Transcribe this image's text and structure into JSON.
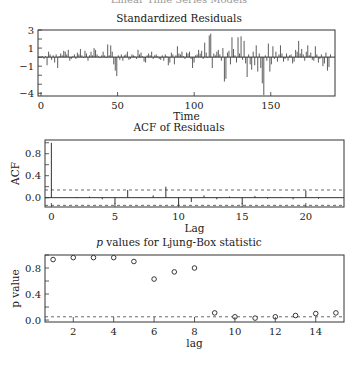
{
  "page": {
    "header": "Linear Time Series Models"
  },
  "chart_data": [
    {
      "type": "bar",
      "title": "Standardized Residuals",
      "xlabel": "Time",
      "ylabel": "",
      "xlim": [
        0,
        190
      ],
      "ylim": [
        -4.3,
        3
      ],
      "xticks": [
        0,
        50,
        100,
        150
      ],
      "yticks": [
        3,
        1,
        -1,
        -4
      ],
      "values": [
        0.0,
        0.1,
        -0.2,
        0.1,
        -0.9,
        0.6,
        0.3,
        -0.3,
        0.2,
        -0.6,
        0.3,
        -1.2,
        0.1,
        0.4,
        0.2,
        0.7,
        0.6,
        0.3,
        0.8,
        -0.4,
        -0.2,
        0.1,
        0.3,
        -0.2,
        0.5,
        0.3,
        0.9,
        0.2,
        -0.1,
        0.7,
        0.4,
        -0.4,
        0.2,
        0.6,
        0.2,
        1.0,
        0.8,
        0.3,
        0.1,
        -0.1,
        0.2,
        0.6,
        0.2,
        -0.1,
        1.4,
        0.2,
        1.3,
        0.6,
        -0.8,
        -1.5,
        -2.1,
        0.2,
        -0.3,
        0.3,
        -0.4,
        0.2,
        0.3,
        0.6,
        -0.3,
        -0.2,
        0.3,
        0.2,
        0.1,
        -0.2,
        0.8,
        0.3,
        0.5,
        0.1,
        -0.5,
        -0.6,
        0.2,
        0.4,
        0.2,
        0.6,
        -0.2,
        0.2,
        0.3,
        0.1,
        -0.2,
        -0.3,
        0.2,
        -0.4,
        0.3,
        0.1,
        -0.9,
        -0.6,
        0.5,
        0.3,
        -0.8,
        0.2,
        1.2,
        0.4,
        0.3,
        0.6,
        0.1,
        -0.2,
        0.5,
        0.4,
        0.6,
        -0.2,
        -1.2,
        -0.6,
        0.2,
        0.3,
        0.8,
        0.4,
        0.7,
        -0.2,
        1.6,
        0.5,
        -0.1,
        2.4,
        2.6,
        -1.2,
        0.4,
        0.2,
        0.6,
        0.8,
        0.3,
        -0.4,
        1.0,
        -2.7,
        -2.4,
        0.5,
        0.7,
        -0.8,
        2.2,
        0.9,
        0.2,
        -0.6,
        2.2,
        0.4,
        2.3,
        -0.3,
        1.8,
        -0.7,
        -2.2,
        0.3,
        -0.8,
        -1.4,
        0.6,
        -0.9,
        1.3,
        -1.6,
        0.4,
        -1.2,
        -2.9,
        -4.2,
        0.2,
        -0.4,
        1.5,
        -1.6,
        -0.8,
        1.2,
        -0.2,
        0.6,
        -0.5,
        0.3,
        1.3,
        0.4,
        -0.5,
        -0.2,
        0.4,
        -0.4,
        0.2,
        0.3,
        -0.7,
        -0.5,
        0.8,
        0.6,
        1.8,
        0.4,
        0.9,
        0.3,
        -0.4,
        0.6,
        1.3,
        0.2,
        0.5,
        -0.3,
        -0.4,
        1.2,
        0.3,
        -0.6,
        -0.2,
        0.3,
        -1.0,
        -0.7,
        0.5,
        -1.5,
        -1.1,
        0.3
      ],
      "grid": false
    },
    {
      "type": "bar",
      "title": "ACF of Residuals",
      "xlabel": "Lag",
      "ylabel": "ACF",
      "xlim": [
        -0.5,
        23
      ],
      "ylim": [
        -0.17,
        1.05
      ],
      "xticks": [
        0,
        5,
        10,
        15,
        20
      ],
      "yticks": [
        0.0,
        0.4,
        0.8
      ],
      "lags": [
        0,
        1,
        2,
        3,
        4,
        5,
        6,
        7,
        8,
        9,
        10,
        11,
        12,
        13,
        14,
        15,
        16,
        17,
        18,
        19,
        20,
        21,
        22
      ],
      "values": [
        1.0,
        0.0,
        -0.01,
        0.02,
        -0.03,
        -0.12,
        0.14,
        0.01,
        0.04,
        0.2,
        -0.13,
        -0.08,
        0.04,
        -0.03,
        0.02,
        -0.12,
        0.03,
        -0.02,
        0.01,
        -0.03,
        0.13,
        -0.02,
        0.0
      ],
      "confidence_band": [
        0.14,
        -0.14
      ],
      "grid": false
    },
    {
      "type": "scatter",
      "title": "p values for Ljung-Box statistic",
      "xlabel": "lag",
      "ylabel": "p value",
      "xlim": [
        0.6,
        15.4
      ],
      "ylim": [
        -0.03,
        1.0
      ],
      "xticks": [
        2,
        4,
        6,
        8,
        10,
        12,
        14
      ],
      "yticks": [
        0.0,
        0.4,
        0.8
      ],
      "x": [
        1,
        2,
        3,
        4,
        5,
        6,
        7,
        8,
        9,
        10,
        11,
        12,
        13,
        14,
        15
      ],
      "values": [
        0.93,
        0.96,
        0.96,
        0.96,
        0.9,
        0.63,
        0.74,
        0.8,
        0.11,
        0.05,
        0.03,
        0.05,
        0.07,
        0.1,
        0.11
      ],
      "reference_line": 0.05,
      "grid": false
    }
  ]
}
